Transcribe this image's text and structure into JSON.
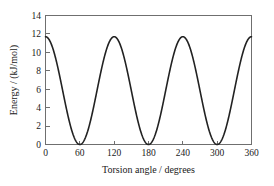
{
  "chart_data": {
    "type": "line",
    "title": "",
    "xlabel": "Torsion angle / degrees",
    "ylabel": "Energy / (kJ/mol)",
    "xlim": [
      0,
      360
    ],
    "ylim": [
      0,
      14
    ],
    "xticks": [
      0,
      60,
      120,
      180,
      240,
      300,
      360
    ],
    "yticks": [
      0,
      2,
      4,
      6,
      8,
      10,
      12,
      14
    ],
    "xtick_labels": [
      "0",
      "60",
      "120",
      "180",
      "240",
      "300",
      "360"
    ],
    "ytick_labels": [
      "0",
      "2",
      "4",
      "6",
      "8",
      "10",
      "12",
      "14"
    ],
    "grid": false,
    "legend": null,
    "series": [
      {
        "name": "Torsional potential",
        "color": "#222222",
        "barrier_height": 11.7,
        "minimum_value": 0,
        "period_degrees": 120,
        "maxima_x": [
          0,
          120,
          240,
          360
        ],
        "minima_x": [
          60,
          180,
          300
        ],
        "x": [
          0,
          10,
          20,
          30,
          40,
          50,
          60,
          70,
          80,
          90,
          100,
          110,
          120,
          130,
          140,
          150,
          160,
          170,
          180,
          190,
          200,
          210,
          220,
          230,
          240,
          250,
          260,
          270,
          280,
          290,
          300,
          310,
          320,
          330,
          340,
          350,
          360
        ],
        "values": [
          11.7,
          11.0,
          8.97,
          5.85,
          2.73,
          0.7,
          0.0,
          0.7,
          2.73,
          5.85,
          8.97,
          11.0,
          11.7,
          11.0,
          8.97,
          5.85,
          2.73,
          0.7,
          0.0,
          0.7,
          2.73,
          5.85,
          8.97,
          11.0,
          11.7,
          11.0,
          8.97,
          5.85,
          2.73,
          0.7,
          0.0,
          0.7,
          2.73,
          5.85,
          8.97,
          11.0,
          11.7
        ]
      }
    ]
  },
  "axes": {
    "x_axis_title": "Torsion angle / degrees",
    "y_axis_title": "Energy / (kJ/mol)"
  }
}
